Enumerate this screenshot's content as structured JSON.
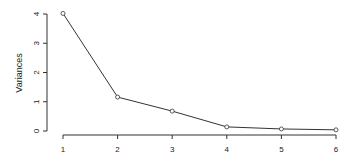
{
  "chart_data": {
    "type": "line",
    "title": "",
    "xlabel": "",
    "ylabel": "Variances",
    "x": [
      1,
      2,
      3,
      4,
      5,
      6
    ],
    "values": [
      4.02,
      1.16,
      0.68,
      0.14,
      0.07,
      0.04
    ],
    "x_ticks": [
      "1",
      "2",
      "3",
      "4",
      "5",
      "6"
    ],
    "y_ticks": [
      "0",
      "1",
      "2",
      "3",
      "4"
    ],
    "xlim": [
      1,
      6
    ],
    "ylim": [
      0,
      4
    ],
    "grid": false,
    "legend": null,
    "marker": "open-circle",
    "line_color": "#333333"
  }
}
